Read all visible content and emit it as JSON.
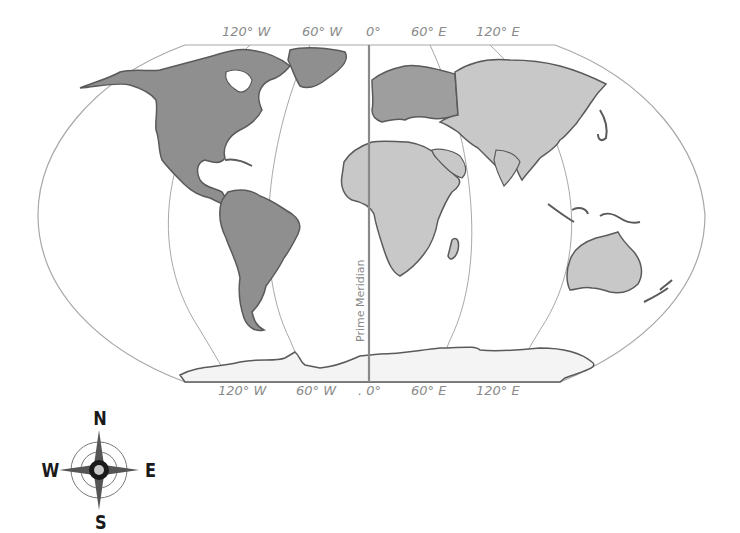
{
  "map": {
    "projection": "Robinson",
    "land_colors": {
      "americas": "#8f8f8f",
      "europe": "#9e9e9e",
      "africa_asia_oceania": "#c8c8c8",
      "antarctica": "#f4f4f4",
      "outline": "#5a5a5a",
      "graticule": "#a8a8a8",
      "prime_meridian": "#8a8a8a"
    },
    "top_labels": [
      "120° W",
      "60° W",
      "0°",
      "60° E",
      "120° E"
    ],
    "bottom_labels": [
      "120° W",
      "60° W",
      ". 0°",
      "60° E",
      "120° E"
    ],
    "prime_meridian_label": "Prime Meridian"
  },
  "compass": {
    "north": "N",
    "south": "S",
    "east": "E",
    "west": "W"
  }
}
